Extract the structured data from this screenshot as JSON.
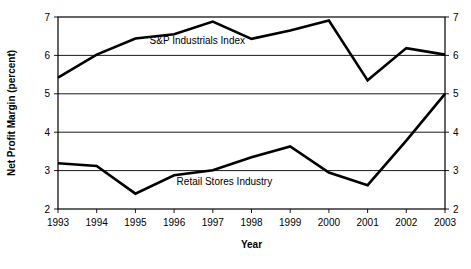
{
  "chart_data": {
    "type": "line",
    "title": "",
    "xlabel": "Year",
    "ylabel": "Net Profit Margin (percent)",
    "categories": [
      "1993",
      "1994",
      "1995",
      "1996",
      "1997",
      "1998",
      "1999",
      "2000",
      "2001",
      "2002",
      "2003"
    ],
    "x": [
      1993,
      1994,
      1995,
      1996,
      1997,
      1998,
      1999,
      2000,
      2001,
      2002,
      2003
    ],
    "ylim": [
      2,
      7
    ],
    "yticks": [
      2,
      3,
      4,
      5,
      6,
      7
    ],
    "ytick_labels_left": [
      "2",
      "3",
      "4",
      "5",
      "6",
      "7"
    ],
    "ytick_labels_right": [
      "2",
      "3",
      "4",
      "5",
      "6",
      "7"
    ],
    "grid": "horizontal",
    "legend_position": "inline-annotation",
    "right_axis": true,
    "series": [
      {
        "name": "S&P Industrials Index",
        "label_x": 1996.6,
        "label_y": 6.38,
        "values": [
          5.42,
          6.02,
          6.44,
          6.55,
          6.88,
          6.43,
          6.65,
          6.91,
          5.35,
          6.19,
          6.02
        ]
      },
      {
        "name": "Retail Stores Industry",
        "label_x": 1997.3,
        "label_y": 2.72,
        "values": [
          3.19,
          3.12,
          2.4,
          2.88,
          3.01,
          3.35,
          3.63,
          2.95,
          2.62,
          3.78,
          5.0
        ]
      }
    ]
  },
  "axes": {
    "x_title": "Year",
    "y_title": "Net Profit Margin (percent)"
  }
}
